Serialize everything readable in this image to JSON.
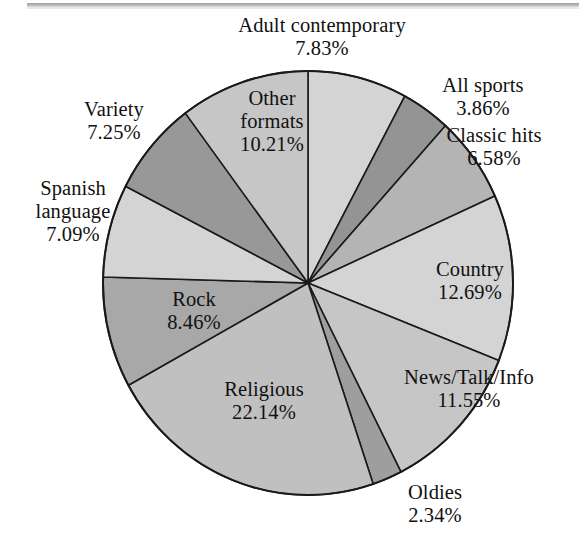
{
  "chart_data": {
    "type": "pie",
    "title": "",
    "subtitle": "",
    "xlabel": "",
    "ylabel": "",
    "legend_position": "none",
    "labels_position": "around-and-inside-slices",
    "unit": "%",
    "start_angle_deg": 0,
    "direction": "clockwise",
    "categories": [
      "Adult contemporary",
      "All sports",
      "Classic hits",
      "Country",
      "News/Talk/Info",
      "Oldies",
      "Religious",
      "Rock",
      "Spanish language",
      "Variety",
      "Other formats"
    ],
    "values": [
      7.83,
      3.86,
      6.58,
      12.69,
      11.55,
      2.34,
      22.14,
      8.46,
      7.09,
      7.25,
      10.21
    ],
    "slices": [
      {
        "name": "Adult contemporary",
        "value": 7.83,
        "value_label": "7.83%",
        "color": "#d4d4d4",
        "label_placement": "outside"
      },
      {
        "name": "All sports",
        "value": 3.86,
        "value_label": "3.86%",
        "color": "#949494",
        "label_placement": "outside"
      },
      {
        "name": "Classic hits",
        "value": 6.58,
        "value_label": "6.58%",
        "color": "#b4b4b4",
        "label_placement": "outside"
      },
      {
        "name": "Country",
        "value": 12.69,
        "value_label": "12.69%",
        "color": "#d4d4d4",
        "label_placement": "outside"
      },
      {
        "name": "News/Talk/Info",
        "value": 11.55,
        "value_label": "11.55%",
        "color": "#c6c6c6",
        "label_placement": "outside"
      },
      {
        "name": "Oldies",
        "value": 2.34,
        "value_label": "2.34%",
        "color": "#9e9e9e",
        "label_placement": "outside"
      },
      {
        "name": "Religious",
        "value": 22.14,
        "value_label": "22.14%",
        "color": "#c0c0c0",
        "label_placement": "inside"
      },
      {
        "name": "Rock",
        "value": 8.46,
        "value_label": "8.46%",
        "color": "#a8a8a8",
        "label_placement": "inside"
      },
      {
        "name": "Spanish language",
        "value": 7.09,
        "value_label": "7.09%",
        "color": "#d4d4d4",
        "label_placement": "outside"
      },
      {
        "name": "Variety",
        "value": 7.25,
        "value_label": "7.25%",
        "color": "#989898",
        "label_placement": "outside"
      },
      {
        "name": "Other formats",
        "value": 10.21,
        "value_label": "10.21%",
        "color": "#c6c6c6",
        "label_placement": "inside"
      }
    ],
    "total": 100.0,
    "stroke_color": "#1a1a1a"
  },
  "labels": {
    "adult_contemporary": {
      "name": "Adult contemporary",
      "value": "7.83%"
    },
    "all_sports": {
      "name": "All sports",
      "value": "3.86%"
    },
    "classic_hits": {
      "name": "Classic hits",
      "value": "6.58%"
    },
    "country": {
      "name": "Country",
      "value": "12.69%"
    },
    "news_talk_info": {
      "name": "News/Talk/Info",
      "value": "11.55%"
    },
    "oldies": {
      "name": "Oldies",
      "value": "2.34%"
    },
    "religious": {
      "name": "Religious",
      "value": "22.14%"
    },
    "rock": {
      "name": "Rock",
      "value": "8.46%"
    },
    "spanish_language": {
      "name_line1": "Spanish",
      "name_line2": "language",
      "value": "7.09%"
    },
    "variety": {
      "name": "Variety",
      "value": "7.25%"
    },
    "other_formats": {
      "name_line1": "Other",
      "name_line2": "formats",
      "value": "10.21%"
    }
  }
}
